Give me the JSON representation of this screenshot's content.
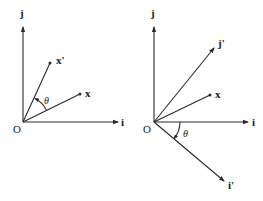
{
  "figure": {
    "background": "#ffffff",
    "line_color": "#2a2a2a",
    "left_panel": {
      "description": "Vector x rotated by angle theta to x'",
      "labels": {
        "origin": "O",
        "i_axis": "i",
        "j_axis": "j",
        "vector_x": "x",
        "vector_x_prime": "x'",
        "angle": "θ"
      }
    },
    "right_panel": {
      "description": "Axes i,j rotated by -theta to i',j' with fixed vector x",
      "labels": {
        "origin": "O",
        "i_axis": "i",
        "j_axis": "j",
        "i_prime_axis": "i'",
        "j_prime_axis": "j'",
        "vector_x": "x",
        "angle": "θ"
      }
    }
  }
}
